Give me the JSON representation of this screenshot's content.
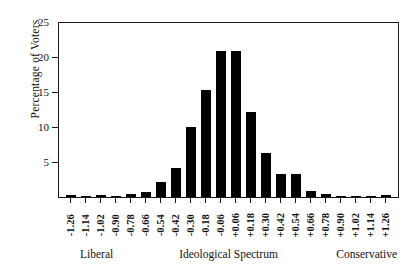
{
  "chart_data": {
    "type": "bar",
    "title": "",
    "xlabel": "Ideological Spectrum",
    "ylabel": "Percentage of Voters",
    "ylim": [
      0,
      25
    ],
    "yticks": [
      0,
      5,
      10,
      15,
      20,
      25
    ],
    "ytick_labels": [
      "",
      "5",
      "10",
      "15",
      "20",
      "25"
    ],
    "grid": false,
    "legend": null,
    "categories": [
      "-1.26",
      "-1.14",
      "-1.02",
      "-0.90",
      "-0.78",
      "-0.66",
      "-0.54",
      "-0.42",
      "-0.30",
      "-0.18",
      "-0.06",
      "+0.06",
      "+0.18",
      "+0.30",
      "+0.42",
      "+0.54",
      "+0.66",
      "+0.78",
      "+0.90",
      "+1.02",
      "+1.14",
      "+1.26"
    ],
    "values": [
      0.25,
      0.2,
      0.25,
      0.15,
      0.4,
      0.7,
      2.2,
      4.2,
      10.0,
      15.3,
      20.9,
      20.8,
      12.1,
      6.3,
      3.3,
      3.3,
      0.9,
      0.5,
      0.05,
      0.05,
      0.2,
      0.3
    ],
    "bar_color": "#000000",
    "axis_color": "#1a1a1a",
    "annotations": {
      "left_pole": "Liberal",
      "center": "Ideological Spectrum",
      "right_pole": "Conservative"
    }
  },
  "axes": {
    "y_title": "Percentage of Voters",
    "y_labels": [
      {
        "text": "25",
        "value": 25
      },
      {
        "text": "20",
        "value": 20
      },
      {
        "text": "15",
        "value": 15
      },
      {
        "text": "10",
        "value": 10
      },
      {
        "text": "5",
        "value": 5
      }
    ]
  },
  "captions": {
    "left": "Liberal",
    "middle": "Ideological Spectrum",
    "right": "Conservative"
  }
}
